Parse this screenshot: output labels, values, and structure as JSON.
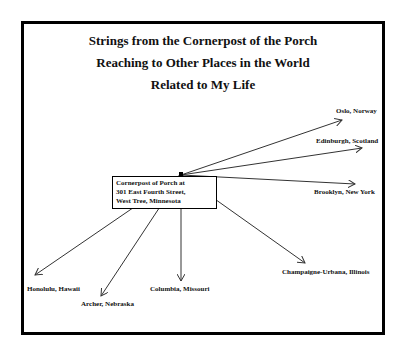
{
  "title": {
    "line1": "Strings from the Cornerpost of the Porch",
    "line2": "Reaching to Other Places in the World",
    "line3": "Related to My Life"
  },
  "origin": {
    "label_line1": "Cornerpost of Porch at",
    "label_line2": "301 East Fourth Street,",
    "label_line3": "West Tree, Minnesota"
  },
  "destinations": [
    {
      "label": "Oslo, Norway"
    },
    {
      "label": "Edinburgh, Scotland"
    },
    {
      "label": "Brooklyn, New York"
    },
    {
      "label": "Champaigne-Urbana, Illinois"
    },
    {
      "label": "Columbia, Missouri"
    },
    {
      "label": "Archer, Nebraska"
    },
    {
      "label": "Honolulu, Hawaii"
    }
  ],
  "colors": {
    "line": "#333333",
    "frame": "#000000",
    "text": "#111111"
  }
}
